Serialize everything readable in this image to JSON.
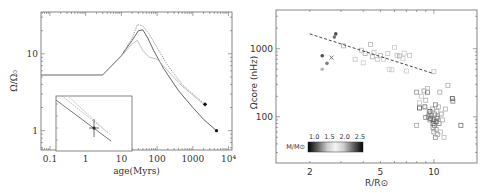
{
  "chart_data": [
    {
      "id": "left",
      "type": "line",
      "xlabel": "age(Myrs)",
      "ylabel": "Ω/Ω₀",
      "xscale": "log",
      "yscale": "log",
      "xlim": [
        0.056,
        12500
      ],
      "ylim": [
        0.56,
        35
      ],
      "x_ticks": [
        {
          "v": 0.1,
          "label": "0.1"
        },
        {
          "v": 1,
          "label": "1"
        },
        {
          "v": 10,
          "label": "10"
        },
        {
          "v": 100,
          "label": "100"
        },
        {
          "v": 1000,
          "label": "1000"
        },
        {
          "v": 10000,
          "label": "10⁴"
        }
      ],
      "y_ticks": [
        {
          "v": 1,
          "label": "1"
        },
        {
          "v": 10,
          "label": "10"
        }
      ],
      "series": [
        {
          "name": "model-solid",
          "style": "solid",
          "color": "#555555",
          "points": [
            [
              0.056,
              5.3
            ],
            [
              3,
              5.3
            ],
            [
              10,
              9.5
            ],
            [
              20,
              15
            ],
            [
              30,
              20
            ],
            [
              40,
              20.5
            ],
            [
              55,
              16
            ],
            [
              80,
              11
            ],
            [
              150,
              6.5
            ],
            [
              400,
              3.3
            ],
            [
              1000,
              2.0
            ],
            [
              2000,
              1.4
            ],
            [
              4600,
              1.0
            ]
          ]
        },
        {
          "name": "model-dotted-upper",
          "style": "dotted",
          "color": "#888888",
          "points": [
            [
              3,
              5.3
            ],
            [
              10,
              9.5
            ],
            [
              20,
              16
            ],
            [
              28,
              24
            ],
            [
              40,
              23
            ],
            [
              60,
              18
            ],
            [
              100,
              12
            ],
            [
              200,
              7
            ],
            [
              500,
              4.0
            ],
            [
              1000,
              3.0
            ],
            [
              2200,
              2.2
            ]
          ]
        },
        {
          "name": "model-light",
          "style": "solid",
          "color": "#bbbbbb",
          "points": [
            [
              3,
              5.3
            ],
            [
              10,
              9.3
            ],
            [
              20,
              13.5
            ],
            [
              28,
              15
            ],
            [
              40,
              11
            ],
            [
              60,
              9.0
            ],
            [
              100,
              8.5
            ],
            [
              200,
              6.0
            ],
            [
              500,
              3.8
            ],
            [
              1000,
              2.9
            ],
            [
              2200,
              2.1
            ]
          ]
        }
      ],
      "markers": [
        {
          "name": "sun-now",
          "x": 4600,
          "y": 1.0,
          "shape": "dot"
        },
        {
          "name": "data-point",
          "x": 2200,
          "y": 2.2,
          "shape": "dot-errorbar"
        }
      ],
      "inset": {
        "present": true,
        "content": "zoom of tracks near data point with error bars"
      }
    },
    {
      "id": "right",
      "type": "scatter",
      "xlabel": "R/R⊙",
      "ylabel": "Ωcore (nHz)",
      "xscale": "log",
      "yscale": "log",
      "xlim": [
        1.29,
        17.5
      ],
      "ylim": [
        21,
        3700
      ],
      "x_ticks": [
        {
          "v": 2,
          "label": "2"
        },
        {
          "v": 5,
          "label": "5"
        },
        {
          "v": 10,
          "label": "10"
        }
      ],
      "y_ticks": [
        {
          "v": 100,
          "label": "100"
        },
        {
          "v": 1000,
          "label": "1000"
        }
      ],
      "colorbar": {
        "label": "M/M⊙",
        "ticks": [
          "1.0",
          "1.5",
          "2.0",
          "2.5"
        ],
        "range": [
          0.8,
          2.6
        ]
      },
      "fit_line": {
        "style": "dashed",
        "points": [
          [
            2.0,
            1650
          ],
          [
            10.0,
            430
          ]
        ]
      },
      "special_points": [
        {
          "x": 2.35,
          "y": 790,
          "shape": "filled-circle",
          "shade": 0.2
        },
        {
          "x": 2.5,
          "y": 610,
          "shape": "filled-circle",
          "shade": 0.45
        },
        {
          "x": 2.35,
          "y": 500,
          "shape": "filled-circle",
          "shade": 0.75
        },
        {
          "x": 2.65,
          "y": 740,
          "shape": "x",
          "shade": 0.3
        },
        {
          "x": 2.8,
          "y": 1650,
          "shape": "filled-circle",
          "shade": 0.2
        },
        {
          "x": 2.75,
          "y": 1480,
          "shape": "filled-circle",
          "shade": 0.4
        }
      ],
      "squares": [
        [
          3.1,
          1100,
          0.7
        ],
        [
          3.6,
          700,
          0.8
        ],
        [
          3.9,
          950,
          0.75
        ],
        [
          4.1,
          850,
          0.7
        ],
        [
          4.0,
          620,
          0.85
        ],
        [
          4.4,
          1150,
          0.75
        ],
        [
          4.5,
          760,
          0.7
        ],
        [
          4.6,
          880,
          0.8
        ],
        [
          4.8,
          700,
          0.8
        ],
        [
          5.0,
          790,
          0.75
        ],
        [
          5.2,
          700,
          0.85
        ],
        [
          5.5,
          850,
          0.8
        ],
        [
          5.6,
          500,
          0.85
        ],
        [
          5.8,
          490,
          0.85
        ],
        [
          6.0,
          1050,
          0.85
        ],
        [
          6.2,
          800,
          0.8
        ],
        [
          6.4,
          780,
          0.7
        ],
        [
          6.7,
          720,
          0.85
        ],
        [
          6.8,
          860,
          0.85
        ],
        [
          7.0,
          470,
          0.85
        ],
        [
          7.3,
          800,
          0.8
        ],
        [
          10.0,
          460,
          0.8
        ],
        [
          8.0,
          230,
          0.55
        ],
        [
          8.3,
          160,
          0.8
        ],
        [
          8.5,
          200,
          0.8
        ],
        [
          8.8,
          240,
          0.6
        ],
        [
          8.9,
          140,
          0.35
        ],
        [
          9.0,
          175,
          0.7
        ],
        [
          9.2,
          230,
          0.4
        ],
        [
          9.2,
          260,
          0.75
        ],
        [
          9.3,
          100,
          0.45
        ],
        [
          9.4,
          110,
          0.6
        ],
        [
          9.5,
          120,
          0.2
        ],
        [
          9.5,
          90,
          0.6
        ],
        [
          9.6,
          95,
          0.3
        ],
        [
          9.7,
          105,
          0.5
        ],
        [
          9.8,
          130,
          0.6
        ],
        [
          9.9,
          80,
          0.2
        ],
        [
          9.9,
          70,
          0.5
        ],
        [
          10.0,
          60,
          0.55
        ],
        [
          10.0,
          90,
          0.3
        ],
        [
          10.1,
          110,
          0.6
        ],
        [
          10.1,
          75,
          0.4
        ],
        [
          10.2,
          150,
          0.5
        ],
        [
          10.2,
          50,
          0.55
        ],
        [
          10.3,
          85,
          0.3
        ],
        [
          10.3,
          65,
          0.6
        ],
        [
          10.4,
          120,
          0.65
        ],
        [
          10.4,
          95,
          0.35
        ],
        [
          10.5,
          100,
          0.55
        ],
        [
          10.5,
          55,
          0.7
        ],
        [
          10.6,
          140,
          0.7
        ],
        [
          10.7,
          80,
          0.5
        ],
        [
          10.8,
          230,
          0.7
        ],
        [
          10.9,
          60,
          0.75
        ],
        [
          11.0,
          110,
          0.6
        ],
        [
          11.2,
          90,
          0.7
        ],
        [
          11.4,
          50,
          0.75
        ],
        [
          11.6,
          130,
          0.7
        ],
        [
          12.0,
          290,
          0.7
        ],
        [
          12.7,
          185,
          0.2
        ],
        [
          12.8,
          170,
          0.45
        ],
        [
          14.2,
          75,
          0.4
        ],
        [
          8.3,
          135,
          0.25
        ],
        [
          8.0,
          75,
          0.65
        ],
        [
          9.0,
          98,
          0.5
        ]
      ]
    }
  ]
}
